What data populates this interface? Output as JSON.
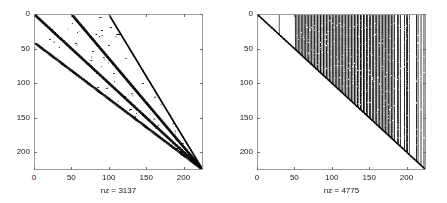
{
  "figure": {
    "width": 447,
    "height": 203,
    "background": "#ffffff",
    "marker_color": "#000000",
    "axis_color": "#9a9a9a",
    "text_color": "#1a1a1a"
  },
  "panels": [
    {
      "name": "left-spy-plot",
      "xlabel": "nz = 3137",
      "xticks": [
        0,
        50,
        100,
        150,
        200
      ],
      "yticks": [
        0,
        50,
        100,
        150,
        200
      ],
      "xlim": [
        0,
        226
      ],
      "ylim": [
        0,
        226
      ]
    },
    {
      "name": "right-spy-plot",
      "xlabel": "nz = 4775",
      "xticks": [
        0,
        50,
        100,
        150,
        200
      ],
      "yticks": [
        0,
        50,
        100,
        150,
        200
      ],
      "xlim": [
        0,
        226
      ],
      "ylim": [
        0,
        226
      ]
    }
  ],
  "chart_data": [
    {
      "type": "scatter",
      "title": "",
      "xlabel": "nz = 3137",
      "ylabel": "",
      "xlim": [
        0,
        226
      ],
      "ylim": [
        0,
        226
      ],
      "y_axis_inverted": true,
      "grid": false,
      "legend": null,
      "marker": "square",
      "marker_color": "#000000",
      "nz": 3137,
      "matrix_size": 226,
      "description": "MATLAB spy plot of a sparse banded matrix: a thick main diagonal plus parallel sub- and super-diagonal bands at offsets about -50, +50 and +100 that converge toward the bottom-right corner, with scattered isolated nonzeros between the bands.",
      "structure": {
        "bands": [
          {
            "offset": 0,
            "thickness": 3,
            "converge": true
          },
          {
            "offset": 50,
            "thickness": 3,
            "converge": true
          },
          {
            "offset": 100,
            "thickness": 2,
            "converge": true
          },
          {
            "offset": -50,
            "thickness": 3,
            "converge": true
          }
        ],
        "scatter_fill": {
          "between_bands": true,
          "density": 0.012
        }
      }
    },
    {
      "type": "scatter",
      "title": "",
      "xlabel": "nz = 4775",
      "ylabel": "",
      "xlim": [
        0,
        226
      ],
      "ylim": [
        0,
        226
      ],
      "y_axis_inverted": true,
      "grid": false,
      "legend": null,
      "marker": "square",
      "marker_color": "#000000",
      "nz": 4775,
      "matrix_size": 226,
      "description": "MATLAB spy plot of a sparse matrix after fill-in: a thin main diagonal plus dense vertical columns of nonzeros running from row 0 down to the diagonal. One isolated column near x=28, then a dense fan of columns beginning near x=50 and continuing to x=226, thinning slightly near the right edge.",
      "structure": {
        "diagonal": {
          "offset": 0,
          "thickness": 2
        },
        "isolated_columns": [
          28
        ],
        "column_fan_start": 50,
        "column_fan_end": 226,
        "column_spacing": 2
      }
    }
  ]
}
